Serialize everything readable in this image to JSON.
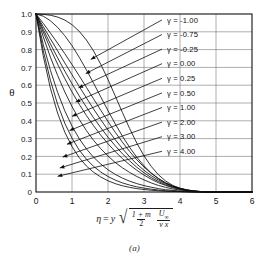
{
  "figure": {
    "caption": "(a)",
    "axis_label_y": "θ",
    "axis_label_x_parts": {
      "eta": "η",
      "equals": "=",
      "y": "y",
      "num_left": "1 + m",
      "den_left": "2",
      "num_right": "U",
      "num_right_sub": "∞",
      "den_right": "ν x"
    }
  },
  "chart_data": {
    "type": "line",
    "title": "",
    "subtitle": "",
    "xlabel": "η = y sqrt( (1+m)/2 * U∞/(ν x) )",
    "ylabel": "θ",
    "xlim": [
      0,
      6
    ],
    "ylim": [
      0,
      1.0
    ],
    "grid": true,
    "legend_position": "inside-right",
    "x_ticks": [
      "0",
      "1",
      "2",
      "3",
      "4",
      "5",
      "6"
    ],
    "x_tick_values": [
      0,
      1,
      2,
      3,
      4,
      5,
      6
    ],
    "y_ticks": [
      "0",
      "0.1",
      "0.2",
      "0.3",
      "0.4",
      "0.5",
      "0.6",
      "0.7",
      "0.8",
      "0.9",
      "1.0"
    ],
    "y_tick_values": [
      0,
      0.1,
      0.2,
      0.3,
      0.4,
      0.5,
      0.6,
      0.7,
      0.8,
      0.9,
      1.0
    ],
    "parameter_symbol": "γ",
    "x": [
      0,
      0.2,
      0.4,
      0.6,
      0.8,
      1.0,
      1.2,
      1.4,
      1.6,
      1.8,
      2.0,
      2.2,
      2.4,
      2.6,
      2.8,
      3.0,
      3.2,
      3.4,
      3.6,
      3.8,
      4.0,
      4.2,
      4.4,
      4.6,
      5.0
    ],
    "series": [
      {
        "name": "γ = -1.00",
        "label": "γ  = -1.00",
        "value": -1.0,
        "values": [
          1.0,
          0.998,
          0.993,
          0.983,
          0.966,
          0.94,
          0.903,
          0.854,
          0.792,
          0.717,
          0.632,
          0.54,
          0.447,
          0.357,
          0.275,
          0.203,
          0.144,
          0.097,
          0.062,
          0.037,
          0.021,
          0.011,
          0.005,
          0.002,
          0.0
        ]
      },
      {
        "name": "γ = -0.75",
        "label": "γ  = -0.75",
        "value": -0.75,
        "values": [
          1.0,
          0.988,
          0.962,
          0.925,
          0.878,
          0.822,
          0.757,
          0.686,
          0.611,
          0.534,
          0.457,
          0.383,
          0.314,
          0.251,
          0.195,
          0.147,
          0.107,
          0.075,
          0.05,
          0.032,
          0.019,
          0.01,
          0.005,
          0.002,
          0.0
        ]
      },
      {
        "name": "γ = -0.25",
        "label": "γ  = -0.25",
        "value": -0.25,
        "values": [
          1.0,
          0.948,
          0.893,
          0.836,
          0.777,
          0.716,
          0.653,
          0.588,
          0.523,
          0.459,
          0.396,
          0.336,
          0.28,
          0.228,
          0.181,
          0.14,
          0.105,
          0.076,
          0.052,
          0.034,
          0.021,
          0.012,
          0.006,
          0.002,
          0.0
        ]
      },
      {
        "name": "γ = 0.00",
        "label": "γ  =  0.00",
        "value": 0.0,
        "values": [
          1.0,
          0.93,
          0.861,
          0.793,
          0.725,
          0.659,
          0.593,
          0.529,
          0.466,
          0.406,
          0.348,
          0.294,
          0.244,
          0.198,
          0.157,
          0.122,
          0.092,
          0.067,
          0.047,
          0.031,
          0.019,
          0.011,
          0.005,
          0.002,
          0.0
        ]
      },
      {
        "name": "γ = 0.25",
        "label": "γ  =  0.25",
        "value": 0.25,
        "values": [
          1.0,
          0.914,
          0.832,
          0.754,
          0.679,
          0.608,
          0.54,
          0.477,
          0.417,
          0.361,
          0.308,
          0.26,
          0.215,
          0.175,
          0.139,
          0.108,
          0.081,
          0.059,
          0.041,
          0.027,
          0.017,
          0.009,
          0.004,
          0.002,
          0.0
        ]
      },
      {
        "name": "γ = 0.50",
        "label": "γ  =  0.50",
        "value": 0.5,
        "values": [
          1.0,
          0.899,
          0.805,
          0.718,
          0.637,
          0.562,
          0.493,
          0.43,
          0.372,
          0.319,
          0.271,
          0.227,
          0.188,
          0.153,
          0.122,
          0.095,
          0.072,
          0.052,
          0.037,
          0.024,
          0.015,
          0.008,
          0.004,
          0.001,
          0.0
        ]
      },
      {
        "name": "γ = 1.00",
        "label": "γ  =  1.00",
        "value": 1.0,
        "values": [
          1.0,
          0.873,
          0.758,
          0.655,
          0.562,
          0.48,
          0.408,
          0.345,
          0.29,
          0.243,
          0.202,
          0.166,
          0.136,
          0.11,
          0.087,
          0.068,
          0.051,
          0.037,
          0.026,
          0.017,
          0.011,
          0.006,
          0.003,
          0.001,
          0.0
        ]
      },
      {
        "name": "γ = 2.00",
        "label": "γ  =  2.00",
        "value": 2.0,
        "values": [
          1.0,
          0.83,
          0.684,
          0.56,
          0.456,
          0.37,
          0.3,
          0.242,
          0.195,
          0.157,
          0.125,
          0.099,
          0.078,
          0.061,
          0.047,
          0.036,
          0.027,
          0.019,
          0.013,
          0.009,
          0.005,
          0.003,
          0.001,
          0.0,
          0.0
        ]
      },
      {
        "name": "γ = 3.00",
        "label": "γ  =  3.00",
        "value": 3.0,
        "values": [
          1.0,
          0.795,
          0.628,
          0.493,
          0.386,
          0.302,
          0.236,
          0.184,
          0.144,
          0.112,
          0.087,
          0.067,
          0.051,
          0.039,
          0.029,
          0.022,
          0.016,
          0.011,
          0.007,
          0.005,
          0.003,
          0.001,
          0.0,
          0.0,
          0.0
        ]
      },
      {
        "name": "γ = 4.00",
        "label": "γ  =  4.00",
        "value": 4.0,
        "values": [
          1.0,
          0.766,
          0.583,
          0.443,
          0.336,
          0.255,
          0.193,
          0.146,
          0.111,
          0.084,
          0.063,
          0.047,
          0.035,
          0.026,
          0.019,
          0.014,
          0.01,
          0.007,
          0.004,
          0.003,
          0.002,
          0.001,
          0.0,
          0.0,
          0.0
        ]
      }
    ],
    "legend_entries": [
      "γ  = -1.00",
      "γ  = -0.75",
      "γ  = -0.25",
      "γ  =  0.00",
      "γ  =  0.25",
      "γ  =  0.50",
      "γ  =  1.00",
      "γ  =  2.00",
      "γ  =  3.00",
      "γ  =  4.00"
    ]
  }
}
